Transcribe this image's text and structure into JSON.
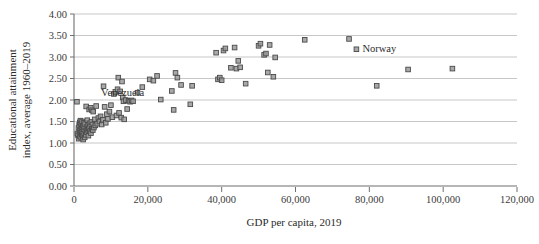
{
  "chart_data": {
    "type": "scatter",
    "title": "",
    "xlabel": "GDP per capita, 2019",
    "ylabel": "Educational attainment index, average 1960–2019",
    "ylabel_line1": "Educational attainment",
    "ylabel_line2": "index, average 1960–2019",
    "xlim": [
      0,
      120000
    ],
    "ylim": [
      0,
      4.0
    ],
    "xticks": [
      0,
      20000,
      40000,
      60000,
      80000,
      100000,
      120000
    ],
    "xtick_labels": [
      "0",
      "20,000",
      "40,000",
      "60,000",
      "80,000",
      "100,000",
      "120,000"
    ],
    "yticks": [
      0.0,
      0.5,
      1.0,
      1.5,
      2.0,
      2.5,
      3.0,
      3.5,
      4.0
    ],
    "ytick_labels": [
      "0.00",
      "0.50",
      "1.00",
      "1.50",
      "2.00",
      "2.50",
      "3.00",
      "3.50",
      "4.00"
    ],
    "grid": "horizontal",
    "legend": "none",
    "marker": "square",
    "marker_fill": "#9a9a9a",
    "marker_stroke": "#4a4a4a",
    "gridline_color": "#b9b9b9",
    "axis_color": "#6f6f6f",
    "annotations": [
      {
        "text": "Venezuela",
        "x": 9500,
        "y": 2.02,
        "anchor": "start",
        "dx": -8,
        "dy": -3
      },
      {
        "text": "Norway",
        "x": 76500,
        "y": 3.18,
        "anchor": "start",
        "dx": 6,
        "dy": 3
      }
    ],
    "points": [
      [
        800,
        1.96
      ],
      [
        900,
        1.22
      ],
      [
        1100,
        1.18
      ],
      [
        1200,
        1.35
      ],
      [
        1250,
        1.1
      ],
      [
        1400,
        1.42
      ],
      [
        1500,
        1.28
      ],
      [
        1550,
        1.48
      ],
      [
        1600,
        1.15
      ],
      [
        1700,
        1.3
      ],
      [
        1750,
        1.52
      ],
      [
        1800,
        1.24
      ],
      [
        1900,
        1.38
      ],
      [
        1950,
        1.12
      ],
      [
        2000,
        1.45
      ],
      [
        2100,
        1.2
      ],
      [
        2150,
        1.33
      ],
      [
        2200,
        1.5
      ],
      [
        2300,
        1.26
      ],
      [
        2350,
        1.16
      ],
      [
        2400,
        1.4
      ],
      [
        2500,
        1.08
      ],
      [
        2600,
        1.32
      ],
      [
        2700,
        1.47
      ],
      [
        2750,
        1.21
      ],
      [
        2800,
        1.36
      ],
      [
        2900,
        1.13
      ],
      [
        3000,
        1.44
      ],
      [
        3100,
        1.29
      ],
      [
        3200,
        1.19
      ],
      [
        3300,
        1.85
      ],
      [
        3400,
        1.37
      ],
      [
        3500,
        1.25
      ],
      [
        3600,
        1.53
      ],
      [
        3700,
        1.31
      ],
      [
        3800,
        1.41
      ],
      [
        3900,
        1.17
      ],
      [
        4000,
        1.34
      ],
      [
        4100,
        1.78
      ],
      [
        4200,
        1.46
      ],
      [
        4300,
        1.27
      ],
      [
        4400,
        1.39
      ],
      [
        4500,
        1.82
      ],
      [
        4600,
        1.23
      ],
      [
        4700,
        1.49
      ],
      [
        4800,
        1.33
      ],
      [
        4900,
        1.76
      ],
      [
        5000,
        1.43
      ],
      [
        5100,
        1.3
      ],
      [
        5200,
        1.73
      ],
      [
        5400,
        1.36
      ],
      [
        5600,
        1.55
      ],
      [
        5800,
        1.41
      ],
      [
        6000,
        1.86
      ],
      [
        6300,
        1.45
      ],
      [
        6600,
        1.58
      ],
      [
        6900,
        1.5
      ],
      [
        7200,
        1.62
      ],
      [
        7500,
        1.43
      ],
      [
        7800,
        1.54
      ],
      [
        8000,
        2.32
      ],
      [
        8300,
        1.84
      ],
      [
        8600,
        1.47
      ],
      [
        8900,
        1.67
      ],
      [
        9200,
        1.56
      ],
      [
        9600,
        1.73
      ],
      [
        10000,
        1.88
      ],
      [
        10400,
        1.6
      ],
      [
        10800,
        2.14
      ],
      [
        11200,
        2.19
      ],
      [
        11500,
        1.64
      ],
      [
        11800,
        2.25
      ],
      [
        12000,
        2.52
      ],
      [
        12200,
        1.7
      ],
      [
        12500,
        2.2
      ],
      [
        12800,
        1.59
      ],
      [
        13000,
        2.43
      ],
      [
        13200,
        2.06
      ],
      [
        13400,
        1.97
      ],
      [
        13600,
        1.55
      ],
      [
        14000,
        2.0
      ],
      [
        14400,
        1.79
      ],
      [
        14800,
        1.98
      ],
      [
        15200,
        1.96
      ],
      [
        15600,
        1.99
      ],
      [
        16000,
        1.97
      ],
      [
        17200,
        2.17
      ],
      [
        18500,
        2.3
      ],
      [
        20500,
        2.48
      ],
      [
        21500,
        2.45
      ],
      [
        22500,
        2.56
      ],
      [
        23500,
        2.01
      ],
      [
        26500,
        2.21
      ],
      [
        27000,
        1.77
      ],
      [
        27500,
        2.63
      ],
      [
        28000,
        2.52
      ],
      [
        29000,
        2.35
      ],
      [
        31500,
        1.9
      ],
      [
        32000,
        2.33
      ],
      [
        38500,
        3.1
      ],
      [
        39000,
        2.48
      ],
      [
        39500,
        2.52
      ],
      [
        40000,
        2.46
      ],
      [
        40500,
        3.15
      ],
      [
        41000,
        3.2
      ],
      [
        42500,
        2.75
      ],
      [
        43500,
        3.22
      ],
      [
        44000,
        2.73
      ],
      [
        44500,
        2.91
      ],
      [
        45000,
        2.76
      ],
      [
        46500,
        2.38
      ],
      [
        50000,
        3.26
      ],
      [
        50500,
        3.31
      ],
      [
        51500,
        3.05
      ],
      [
        52000,
        3.08
      ],
      [
        52500,
        2.64
      ],
      [
        53000,
        3.28
      ],
      [
        54000,
        2.54
      ],
      [
        54500,
        2.99
      ],
      [
        62500,
        3.4
      ],
      [
        74500,
        3.42
      ],
      [
        76500,
        3.18
      ],
      [
        82000,
        2.33
      ],
      [
        90500,
        2.71
      ],
      [
        102500,
        2.73
      ]
    ]
  }
}
